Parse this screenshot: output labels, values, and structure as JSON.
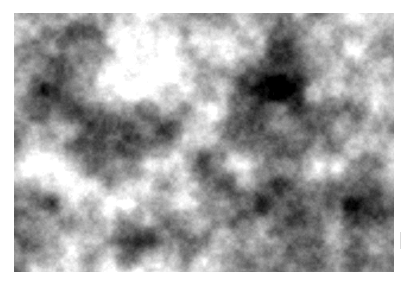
{
  "figure": {
    "title": "Grayscale fractal cloud noise texture",
    "kind": "raster-texture-panel",
    "alt_text": "Monochrome cloud-like fractal noise filling a rectangular panel on a white background"
  },
  "canvas": {
    "width": 411,
    "height": 295,
    "background_color": "#ffffff"
  },
  "texture": {
    "x": 14,
    "y": 13,
    "width": 380,
    "height": 259,
    "color_model": "grayscale",
    "min_gray": "#000000",
    "max_gray": "#ffffff",
    "mean_gray": "#8a8a8a",
    "noise_type": "fractal-brownian-motion",
    "octaves": 6,
    "base_cell_px": 38,
    "persistence": 0.55,
    "lacunarity": 2.0,
    "contrast": 1.55,
    "brightness": 0.02,
    "seed": 20240517,
    "features": [
      {
        "name": "dark-blob-top-right",
        "x": 281,
        "y": 66,
        "tone": "dark"
      },
      {
        "name": "dark-blob-upper-left",
        "x": 54,
        "y": 92,
        "tone": "dark"
      },
      {
        "name": "bright-blob-lower-left",
        "x": 78,
        "y": 198,
        "tone": "bright"
      },
      {
        "name": "dark-blob-center-bottom",
        "x": 231,
        "y": 206,
        "tone": "dark"
      },
      {
        "name": "dark-blob-bottom-right",
        "x": 305,
        "y": 258,
        "tone": "dark"
      },
      {
        "name": "bright-band-upper-center",
        "x": 160,
        "y": 50,
        "tone": "bright"
      }
    ]
  },
  "edge_tick": {
    "x": 400,
    "y": 232,
    "width": 1,
    "height": 17,
    "color": "#d9d9d9"
  }
}
